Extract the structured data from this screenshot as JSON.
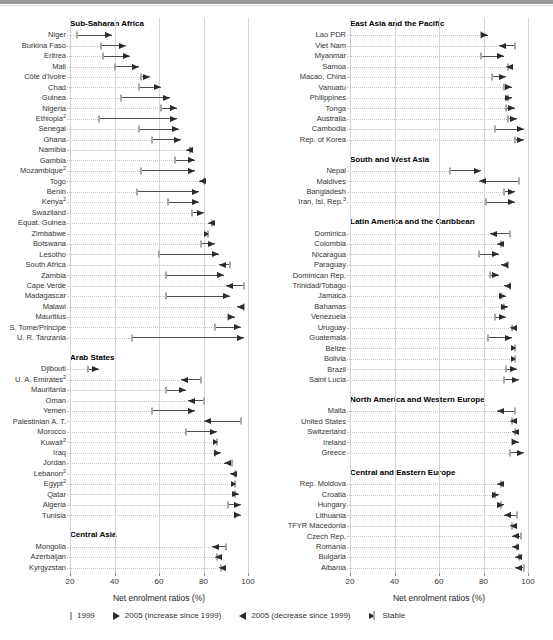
{
  "colors": {
    "arrow": "#2b2b2b",
    "tick1999": "#a9a9a9",
    "connector": "#4d4d4d",
    "grid": "#d4d4d4",
    "leader": "#c4c4c4",
    "header_text": "#000000",
    "label_text": "#333333",
    "top_rule": "#9b9b9b"
  },
  "chart_data": {
    "type": "scatter",
    "subtype": "dot-range-arrows",
    "xlabel": "Net enrolment ratios (%)",
    "x_ticks": [
      20,
      40,
      60,
      80,
      100
    ],
    "x_range": [
      20,
      100
    ],
    "grid": true,
    "legend_position": "bottom",
    "legend": [
      {
        "key": "y1999",
        "label": "1999"
      },
      {
        "key": "inc",
        "label": "2005 (increase since 1999)"
      },
      {
        "key": "dec",
        "label": "2005 (decrease since 1999)"
      },
      {
        "key": "stable",
        "label": "Stable"
      }
    ],
    "panels": [
      {
        "id": "left",
        "sections": [
          {
            "title": "Sub-Saharan Africa",
            "rows": [
              {
                "label": "Niger",
                "v1999": 23,
                "v2005": 39,
                "dir": "inc"
              },
              {
                "label": "Burkina Faso",
                "v1999": 34,
                "v2005": 45,
                "dir": "inc"
              },
              {
                "label": "Eritrea",
                "v1999": 35,
                "v2005": 47,
                "dir": "inc"
              },
              {
                "label": "Mali",
                "v1999": 40,
                "v2005": 51,
                "dir": "inc"
              },
              {
                "label": "Côte d'Ivoire",
                "v1999": 52,
                "v2005": 56,
                "dir": "inc"
              },
              {
                "label": "Chad",
                "v1999": 51,
                "v2005": 61,
                "dir": "inc"
              },
              {
                "label": "Guinea",
                "v1999": 43,
                "v2005": 65,
                "dir": "inc"
              },
              {
                "label": "Nigeria",
                "v1999": 61,
                "v2005": 68,
                "dir": "inc"
              },
              {
                "label": "Ethiopia",
                "sup": "2",
                "v1999": 33,
                "v2005": 68,
                "dir": "inc"
              },
              {
                "label": "Senegal",
                "v1999": 51,
                "v2005": 69,
                "dir": "inc"
              },
              {
                "label": "Ghana",
                "v1999": 57,
                "v2005": 70,
                "dir": "inc"
              },
              {
                "label": "Namibia",
                "v1999": 74,
                "v2005": 72,
                "dir": "dec"
              },
              {
                "label": "Gambia",
                "v1999": 67,
                "v2005": 76,
                "dir": "inc"
              },
              {
                "label": "Mozambique",
                "sup": "2",
                "v1999": 52,
                "v2005": 76,
                "dir": "inc"
              },
              {
                "label": "Togo",
                "v1999": 80,
                "v2005": 78,
                "dir": "dec"
              },
              {
                "label": "Benin",
                "v1999": 50,
                "v2005": 78,
                "dir": "inc"
              },
              {
                "label": "Kenya",
                "sup": "2",
                "v1999": 64,
                "v2005": 78,
                "dir": "inc"
              },
              {
                "label": "Swaziland",
                "v1999": 75,
                "v2005": 80,
                "dir": "inc"
              },
              {
                "label": "Equat. Guinea",
                "v1999": 84,
                "v2005": 82,
                "dir": "dec"
              },
              {
                "label": "Zimbabwe",
                "v1999": 82,
                "v2005": 82,
                "dir": "stable"
              },
              {
                "label": "Botswana",
                "v1999": 79,
                "v2005": 85,
                "dir": "inc"
              },
              {
                "label": "Lesotho",
                "v1999": 60,
                "v2005": 87,
                "dir": "inc"
              },
              {
                "label": "South Africa",
                "v1999": 92,
                "v2005": 87,
                "dir": "dec"
              },
              {
                "label": "Zambia",
                "v1999": 63,
                "v2005": 89,
                "dir": "inc"
              },
              {
                "label": "Cape Verde",
                "v1999": 98,
                "v2005": 90,
                "dir": "dec"
              },
              {
                "label": "Madagascar",
                "v1999": 63,
                "v2005": 92,
                "dir": "inc"
              },
              {
                "label": "Malawi",
                "v1999": 98,
                "v2005": 95,
                "dir": "dec"
              },
              {
                "label": "Mauritius",
                "v1999": 91,
                "v2005": 94,
                "dir": "inc"
              },
              {
                "label": "S. Tome/Principe",
                "v1999": 85,
                "v2005": 97,
                "dir": "inc"
              },
              {
                "label": "U. R. Tanzania",
                "v1999": 48,
                "v2005": 98,
                "dir": "inc"
              }
            ]
          },
          {
            "title": "Arab States",
            "rows": [
              {
                "label": "Djibouti",
                "v1999": 28,
                "v2005": 33,
                "dir": "inc"
              },
              {
                "label": "U. A. Emirates",
                "sup": "2",
                "v1999": 79,
                "v2005": 70,
                "dir": "dec"
              },
              {
                "label": "Mauritania",
                "v1999": 63,
                "v2005": 72,
                "dir": "inc"
              },
              {
                "label": "Oman",
                "v1999": 80,
                "v2005": 73,
                "dir": "dec"
              },
              {
                "label": "Yemen",
                "v1999": 57,
                "v2005": 76,
                "dir": "inc"
              },
              {
                "label": "Palestinian A. T.",
                "v1999": 97,
                "v2005": 80,
                "dir": "dec"
              },
              {
                "label": "Morocco",
                "v1999": 72,
                "v2005": 86,
                "dir": "inc"
              },
              {
                "label": "Kuwait",
                "sup": "2",
                "v1999": 86,
                "v2005": 86,
                "dir": "stable"
              },
              {
                "label": "Iraq",
                "v1999": 85,
                "v2005": 88,
                "dir": "inc"
              },
              {
                "label": "Jordan",
                "v1999": 93,
                "v2005": 89,
                "dir": "dec"
              },
              {
                "label": "Lebanon",
                "sup": "2",
                "v1999": 94,
                "v2005": 92,
                "dir": "dec"
              },
              {
                "label": "Egypt",
                "sup": "2",
                "v1999": 94,
                "v2005": 94,
                "dir": "stable"
              },
              {
                "label": "Qatar",
                "v1999": 94,
                "v2005": 96,
                "dir": "inc"
              },
              {
                "label": "Algeria",
                "v1999": 91,
                "v2005": 97,
                "dir": "inc"
              },
              {
                "label": "Tunisia",
                "v1999": 94,
                "v2005": 97,
                "dir": "inc"
              }
            ]
          },
          {
            "title": "Central Asia",
            "rows": [
              {
                "label": "Mongolia",
                "v1999": 90,
                "v2005": 84,
                "dir": "dec"
              },
              {
                "label": "Azerbaijan",
                "v1999": 86,
                "v2005": 85,
                "dir": "dec"
              },
              {
                "label": "Kyrgyzstan",
                "v1999": 88,
                "v2005": 87,
                "dir": "dec"
              }
            ]
          }
        ]
      },
      {
        "id": "right",
        "sections": [
          {
            "title": "East Asia and the Pacific",
            "rows": [
              {
                "label": "Lao PDR",
                "v1999": 79,
                "v2005": 82,
                "dir": "inc"
              },
              {
                "label": "Viet Nam",
                "v1999": 94,
                "v2005": 87,
                "dir": "dec"
              },
              {
                "label": "Myanmar",
                "v1999": 79,
                "v2005": 89,
                "dir": "inc"
              },
              {
                "label": "Samoa",
                "v1999": 91,
                "v2005": 90,
                "dir": "dec"
              },
              {
                "label": "Macao, China",
                "v1999": 84,
                "v2005": 90,
                "dir": "inc"
              },
              {
                "label": "Vanuatu",
                "v1999": 89,
                "v2005": 93,
                "dir": "inc"
              },
              {
                "label": "Philippines",
                "v1999": 91,
                "v2005": 93,
                "dir": "inc"
              },
              {
                "label": "Tonga",
                "v1999": 90,
                "v2005": 94,
                "dir": "inc"
              },
              {
                "label": "Australia",
                "v1999": 91,
                "v2005": 95,
                "dir": "inc"
              },
              {
                "label": "Cambodia",
                "v1999": 85,
                "v2005": 98,
                "dir": "inc"
              },
              {
                "label": "Rep. of Korea",
                "v1999": 94,
                "v2005": 98,
                "dir": "inc"
              }
            ]
          },
          {
            "title": "South and West Asia",
            "rows": [
              {
                "label": "Nepal",
                "v1999": 65,
                "v2005": 79,
                "dir": "inc"
              },
              {
                "label": "Maldives",
                "v1999": 96,
                "v2005": 78,
                "dir": "dec"
              },
              {
                "label": "Bangladesh",
                "v1999": 89,
                "v2005": 94,
                "dir": "inc"
              },
              {
                "label": "Iran, Isl. Rep.",
                "sup": "3",
                "v1999": 81,
                "v2005": 94,
                "dir": "inc"
              }
            ]
          },
          {
            "title": "Latin America and the Caribbean",
            "rows": [
              {
                "label": "Dominica",
                "v1999": 92,
                "v2005": 83,
                "dir": "dec"
              },
              {
                "label": "Colombia",
                "v1999": 88,
                "v2005": 86,
                "dir": "dec"
              },
              {
                "label": "Nicaragua",
                "v1999": 78,
                "v2005": 87,
                "dir": "inc"
              },
              {
                "label": "Paraguay",
                "v1999": 91,
                "v2005": 88,
                "dir": "dec"
              },
              {
                "label": "Dominican Rep.",
                "v1999": 83,
                "v2005": 87,
                "dir": "inc"
              },
              {
                "label": "Trinidad/Tobago",
                "v1999": 92,
                "v2005": 89,
                "dir": "dec"
              },
              {
                "label": "Jamaica",
                "v1999": 88,
                "v2005": 90,
                "dir": "inc"
              },
              {
                "label": "Bahamas",
                "v1999": 89,
                "v2005": 91,
                "dir": "inc"
              },
              {
                "label": "Venezuela",
                "v1999": 85,
                "v2005": 90,
                "dir": "inc"
              },
              {
                "label": "Uruguay",
                "v1999": 93,
                "v2005": 92,
                "dir": "dec"
              },
              {
                "label": "Guatemala",
                "v1999": 82,
                "v2005": 93,
                "dir": "inc"
              },
              {
                "label": "Belize",
                "v1999": 94,
                "v2005": 94,
                "dir": "stable"
              },
              {
                "label": "Bolivia",
                "v1999": 94,
                "v2005": 94,
                "dir": "stable"
              },
              {
                "label": "Brazil",
                "v1999": 90,
                "v2005": 95,
                "dir": "inc"
              },
              {
                "label": "Saint Lucia",
                "v1999": 89,
                "v2005": 96,
                "dir": "inc"
              }
            ]
          },
          {
            "title": "North America and Western Europe",
            "rows": [
              {
                "label": "Malta",
                "v1999": 94,
                "v2005": 86,
                "dir": "dec"
              },
              {
                "label": "United States",
                "v1999": 93,
                "v2005": 92,
                "dir": "dec"
              },
              {
                "label": "Switzerland",
                "v1999": 94,
                "v2005": 93,
                "dir": "dec"
              },
              {
                "label": "Ireland",
                "v1999": 93,
                "v2005": 96,
                "dir": "inc"
              },
              {
                "label": "Greece",
                "v1999": 92,
                "v2005": 98,
                "dir": "inc"
              }
            ]
          },
          {
            "title": "Central and Eastern Europe",
            "rows": [
              {
                "label": "Rep. Moldova",
                "v1999": 88,
                "v2005": 86,
                "dir": "dec"
              },
              {
                "label": "Croatia",
                "v1999": 85,
                "v2005": 87,
                "dir": "inc"
              },
              {
                "label": "Hungary",
                "v1999": 88,
                "v2005": 89,
                "dir": "inc"
              },
              {
                "label": "Lithuania",
                "v1999": 95,
                "v2005": 89,
                "dir": "dec"
              },
              {
                "label": "TFYR Macedonia",
                "v1999": 93,
                "v2005": 92,
                "dir": "dec"
              },
              {
                "label": "Czech Rep.",
                "v1999": 97,
                "v2005": 93,
                "dir": "dec"
              },
              {
                "label": "Romania",
                "v1999": 95,
                "v2005": 93,
                "dir": "dec"
              },
              {
                "label": "Bulgaria",
                "v1999": 96,
                "v2005": 94,
                "dir": "dec"
              },
              {
                "label": "Albania",
                "v1999": 98,
                "v2005": 94,
                "dir": "dec"
              }
            ]
          }
        ]
      }
    ]
  }
}
